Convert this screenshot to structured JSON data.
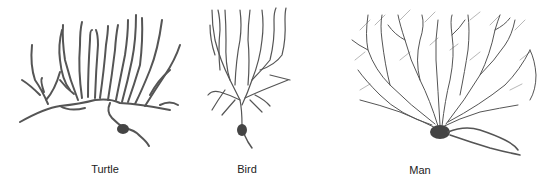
{
  "figure": {
    "panels": [
      {
        "label": "Turtle"
      },
      {
        "label": "Bird"
      },
      {
        "label": "Man"
      }
    ],
    "colors": {
      "ink": "#555555",
      "background": "#ffffff"
    }
  }
}
